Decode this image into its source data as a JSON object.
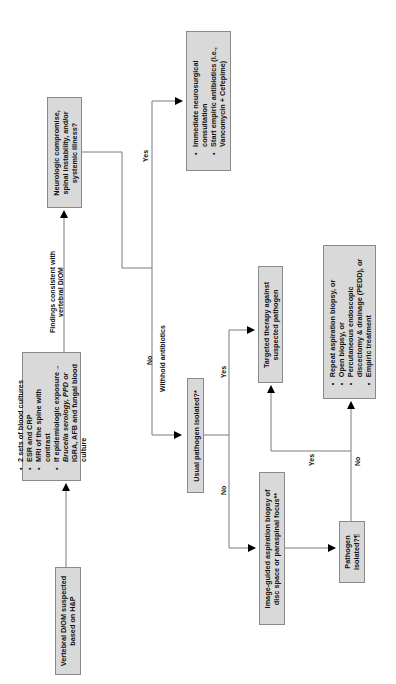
{
  "diagram": {
    "orientation": "rotated-90-ccw",
    "colors": {
      "box_fill": "#d9d9d9",
      "box_border": "#8a8a8a",
      "line": "#7a7a7a",
      "arrow": "#000000",
      "text": "#111111"
    },
    "nodes": {
      "start": {
        "lines": [
          "Vertebral D/OM suspected",
          "based on H&P"
        ]
      },
      "workup": {
        "items": [
          "2 sets of blood cultures",
          "ESR and CRP",
          "MRI of the spine with",
          "contrast",
          "If epidemiologic exposure→",
          "Brucella serology, PPD or",
          "IGRA, AFB and fungal blood",
          "culture"
        ]
      },
      "neuro_question": {
        "lines": [
          "Neurologic compromise,",
          "spinal instability, and/or",
          "systemic illness?"
        ]
      },
      "emergency": {
        "items": [
          "Immediate neurosurgical",
          "consultation",
          "Start empiric antibiotics (i.e.,",
          "Vancomycin + Cefepime)"
        ]
      },
      "usual_pathogen": {
        "lines": [
          "Usual pathogen isolated?*"
        ]
      },
      "targeted": {
        "lines": [
          "Targeted therapy against",
          "suspected pathogen"
        ]
      },
      "biopsy": {
        "lines": [
          "Image-guided aspiration biopsy of",
          "disc space or paraspinal focus**"
        ]
      },
      "pathogen_isolated": {
        "lines": [
          "Pathogen",
          "isolated?¶"
        ]
      },
      "next_steps": {
        "items": [
          "Repeat aspiration biopsy, or",
          "Open biopsy, or",
          "Percutaneous endoscopic",
          "discectomy & drainage (PEDD), or",
          "Empiric treatment"
        ]
      }
    },
    "edge_labels": {
      "findings": [
        "Findings consistent with",
        "vertebral D/OM"
      ],
      "neuro_yes": "Yes",
      "neuro_no": "No",
      "withhold": "Withhold antibiotics",
      "usual_yes": "Yes",
      "usual_no": "No",
      "path_yes": "Yes",
      "path_no": "No"
    }
  }
}
